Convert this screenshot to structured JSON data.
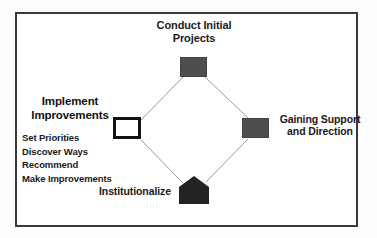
{
  "diagram": {
    "title": "",
    "frame": {
      "border_color": "#3a3a3a",
      "background_color": "#ffffff"
    },
    "edge_color": "#9a9a9a",
    "nodes": [
      {
        "id": "conduct-initial-projects",
        "shape": "rectangle",
        "fill": "#4e4e4e",
        "label_line1": "Conduct Initial",
        "label_line2": "Projects",
        "label_position": "above"
      },
      {
        "id": "gaining-support-and-direction",
        "shape": "rectangle",
        "fill": "#4e4e4e",
        "label_line1": "Gaining Support",
        "label_line2": "and Direction",
        "label_position": "right"
      },
      {
        "id": "institutionalize",
        "shape": "pentagon",
        "fill": "#232323",
        "label_line1": "Institutionalize",
        "label_line2": "",
        "label_position": "left"
      },
      {
        "id": "implement-improvements",
        "shape": "rectangle-outline",
        "fill": "#ffffff",
        "stroke": "#121212",
        "label_line1": "Implement",
        "label_line2": "Improvements",
        "label_position": "above"
      }
    ],
    "left_panel": {
      "heading_line1": "Implement",
      "heading_line2": "Improvements",
      "items": [
        "Set Priorities",
        "Discover Ways",
        "Recommend",
        "Make Improvements"
      ]
    }
  }
}
